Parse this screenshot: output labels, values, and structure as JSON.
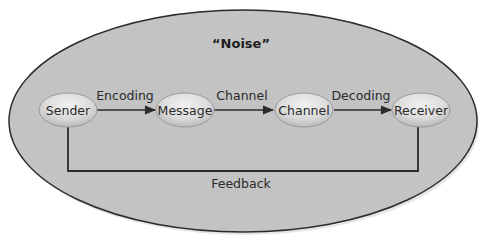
{
  "diagram": {
    "type": "communication-process-model",
    "title": "“Noise”",
    "colors": {
      "background": "#ffffff",
      "outer_fill": "#c3c3c3",
      "outer_stroke": "#2b2b2b",
      "node_fill_light": "#ececec",
      "node_fill_dark": "#bdbdbd",
      "node_stroke": "#9a9a9a",
      "line": "#2b2b2b",
      "text": "#2a2a2a"
    },
    "nodes": [
      {
        "id": "sender",
        "label": "Sender"
      },
      {
        "id": "message",
        "label": "Message"
      },
      {
        "id": "channel",
        "label": "Channel"
      },
      {
        "id": "receiver",
        "label": "Receiver"
      }
    ],
    "edges": [
      {
        "from": "sender",
        "to": "message",
        "label": "Encoding"
      },
      {
        "from": "message",
        "to": "channel",
        "label": "Channel"
      },
      {
        "from": "channel",
        "to": "receiver",
        "label": "Decoding"
      },
      {
        "from": "receiver",
        "to": "sender",
        "label": "Feedback"
      }
    ]
  }
}
